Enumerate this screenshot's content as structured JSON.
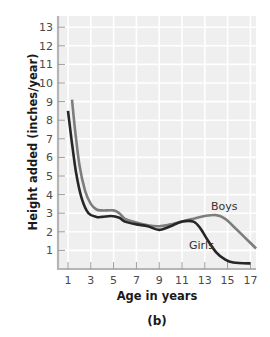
{
  "chart_data": {
    "type": "line",
    "title": "",
    "panel_label": "(b)",
    "xlabel": "Age in years",
    "ylabel": "Height added (inches/year)",
    "xlim": [
      0.5,
      17.7
    ],
    "ylim": [
      0,
      13.5
    ],
    "x_ticks": [
      1,
      3,
      5,
      7,
      9,
      11,
      13,
      15,
      17
    ],
    "y_ticks": [
      1,
      2,
      3,
      4,
      5,
      6,
      7,
      8,
      9,
      10,
      11,
      12,
      13
    ],
    "grid": true,
    "legend": "inline labels",
    "series": [
      {
        "name": "Boys",
        "color": "#7d7d7d",
        "points": [
          [
            1.35,
            9.1
          ],
          [
            1.6,
            7.6
          ],
          [
            2.0,
            5.6
          ],
          [
            2.5,
            4.2
          ],
          [
            3,
            3.5
          ],
          [
            3.5,
            3.2
          ],
          [
            4,
            3.15
          ],
          [
            5,
            3.15
          ],
          [
            5.5,
            3.0
          ],
          [
            6,
            2.7
          ],
          [
            7,
            2.5
          ],
          [
            8,
            2.35
          ],
          [
            9,
            2.3
          ],
          [
            10,
            2.4
          ],
          [
            11,
            2.55
          ],
          [
            12,
            2.7
          ],
          [
            13,
            2.85
          ],
          [
            14,
            2.9
          ],
          [
            14.8,
            2.7
          ],
          [
            15.5,
            2.3
          ],
          [
            16.5,
            1.7
          ],
          [
            17.5,
            1.1
          ]
        ]
      },
      {
        "name": "Girls",
        "color": "#262626",
        "points": [
          [
            1.0,
            8.5
          ],
          [
            1.3,
            7.0
          ],
          [
            1.7,
            5.2
          ],
          [
            2.2,
            3.8
          ],
          [
            2.8,
            3.0
          ],
          [
            3.5,
            2.8
          ],
          [
            4,
            2.8
          ],
          [
            4.8,
            2.85
          ],
          [
            5.5,
            2.75
          ],
          [
            6,
            2.55
          ],
          [
            7,
            2.4
          ],
          [
            8,
            2.3
          ],
          [
            9,
            2.1
          ],
          [
            10,
            2.3
          ],
          [
            11,
            2.55
          ],
          [
            12,
            2.55
          ],
          [
            12.6,
            2.2
          ],
          [
            13.2,
            1.6
          ],
          [
            14,
            0.9
          ],
          [
            14.8,
            0.5
          ],
          [
            15.5,
            0.35
          ],
          [
            17,
            0.3
          ]
        ]
      }
    ]
  }
}
